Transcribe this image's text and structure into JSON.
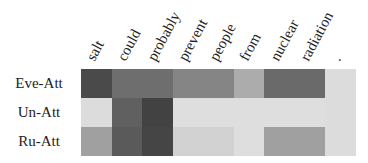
{
  "chart_data": {
    "type": "heatmap",
    "title": "",
    "x_labels": [
      "salt",
      "could",
      "probably",
      "prevent",
      "people",
      "from",
      "nuclear",
      "radiation",
      "."
    ],
    "y_labels": [
      "Eve-Att",
      "Un-Att",
      "Ru-Att"
    ],
    "colormap": "grayscale (darker = higher attention)",
    "values": [
      [
        0.85,
        0.68,
        0.68,
        0.56,
        0.56,
        0.36,
        0.7,
        0.7,
        0.15
      ],
      [
        0.15,
        0.75,
        0.9,
        0.13,
        0.13,
        0.13,
        0.13,
        0.13,
        0.15
      ],
      [
        0.42,
        0.78,
        0.88,
        0.2,
        0.2,
        0.13,
        0.42,
        0.42,
        0.15
      ]
    ],
    "colors": [
      [
        "#4a4a4a",
        "#6e6e6e",
        "#6e6e6e",
        "#858585",
        "#858585",
        "#acacac",
        "#6a6a6a",
        "#6a6a6a",
        "#dcdcdc"
      ],
      [
        "#dcdcdc",
        "#606060",
        "#424242",
        "#dedede",
        "#dedede",
        "#dedede",
        "#dedede",
        "#dedede",
        "#dcdcdc"
      ],
      [
        "#a0a0a0",
        "#5a5a5a",
        "#454545",
        "#d2d2d2",
        "#d2d2d2",
        "#dedede",
        "#a0a0a0",
        "#a0a0a0",
        "#dcdcdc"
      ]
    ],
    "legend": "none",
    "grid": false
  }
}
